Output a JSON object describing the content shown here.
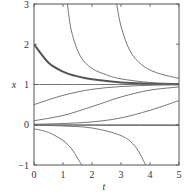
{
  "chart_data": {
    "type": "line",
    "title": "",
    "xlabel": "t",
    "ylabel": "x",
    "xlim": [
      0,
      5
    ],
    "ylim": [
      -1,
      3
    ],
    "xticks": [
      "0",
      "1",
      "2",
      "3",
      "4",
      "5"
    ],
    "yticks": [
      "−1",
      "0",
      "1",
      "2",
      "3"
    ],
    "grid": false,
    "legend": null,
    "equilibria": [
      0,
      1
    ],
    "series": [
      {
        "name": "x0=2 (highlighted)",
        "highlight": true,
        "t": [
          0,
          0.5,
          1,
          1.5,
          2,
          3,
          4,
          5
        ],
        "x": [
          2.0,
          1.54,
          1.32,
          1.2,
          1.13,
          1.05,
          1.02,
          1.01
        ]
      },
      {
        "name": "blow-up from above, t≈1.2",
        "t": [
          1.15,
          1.3,
          1.6,
          2,
          2.5,
          3,
          4,
          5
        ],
        "x": [
          3.0,
          2.3,
          1.7,
          1.4,
          1.24,
          1.14,
          1.05,
          1.02
        ]
      },
      {
        "name": "blow-up from above, t≈2.9",
        "t": [
          2.85,
          3.0,
          3.3,
          3.7,
          4.2,
          5
        ],
        "x": [
          3.0,
          2.45,
          1.85,
          1.5,
          1.3,
          1.15
        ]
      },
      {
        "name": "x=1 equilibrium",
        "t": [
          0,
          5
        ],
        "x": [
          1,
          1
        ]
      },
      {
        "name": "x0=0.5",
        "t": [
          0,
          1,
          2,
          3,
          4,
          5
        ],
        "x": [
          0.5,
          0.73,
          0.88,
          0.95,
          0.98,
          0.99
        ]
      },
      {
        "name": "x0=0.1",
        "t": [
          0,
          1,
          2,
          3,
          4,
          5
        ],
        "x": [
          0.1,
          0.23,
          0.45,
          0.69,
          0.86,
          0.94
        ]
      },
      {
        "name": "x0=0.01",
        "t": [
          0,
          1,
          2,
          3,
          4,
          5
        ],
        "x": [
          0.01,
          0.03,
          0.07,
          0.17,
          0.36,
          0.6
        ]
      },
      {
        "name": "x=0 equilibrium",
        "t": [
          0,
          5
        ],
        "x": [
          0,
          0
        ]
      },
      {
        "name": "x0=-0.01 near zero",
        "t": [
          0,
          5
        ],
        "x": [
          -0.01,
          -0.02
        ]
      },
      {
        "name": "x0=-0.1",
        "t": [
          0,
          0.5,
          1,
          1.3,
          1.5,
          1.65
        ],
        "x": [
          -0.1,
          -0.19,
          -0.39,
          -0.6,
          -0.83,
          -1.0
        ]
      },
      {
        "name": "x0=-0.01",
        "t": [
          0,
          1,
          2,
          3,
          3.5,
          3.85
        ],
        "x": [
          -0.01,
          -0.03,
          -0.08,
          -0.27,
          -0.55,
          -1.0
        ]
      }
    ]
  },
  "axes": {
    "xlabel": "t",
    "ylabel": "x",
    "xtick_labels": [
      "0",
      "1",
      "2",
      "3",
      "4",
      "5"
    ],
    "ytick_labels": [
      "−1",
      "0",
      "1",
      "2",
      "3"
    ]
  }
}
